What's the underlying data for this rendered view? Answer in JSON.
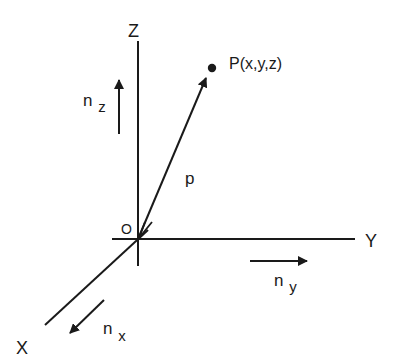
{
  "diagram": {
    "type": "3d-coordinate-system",
    "stroke_color": "#1a1a1a",
    "background": "#ffffff",
    "axes": {
      "z": {
        "label": "Z"
      },
      "y": {
        "label": "Y"
      },
      "x": {
        "label": "X"
      }
    },
    "origin": {
      "label": "O"
    },
    "point": {
      "label": "P(x,y,z)"
    },
    "position_vector": {
      "label": "p"
    },
    "unit_vectors": {
      "nz": {
        "base": "n",
        "sub": "z"
      },
      "ny": {
        "base": "n",
        "sub": "y"
      },
      "nx": {
        "base": "n",
        "sub": "x"
      }
    }
  }
}
